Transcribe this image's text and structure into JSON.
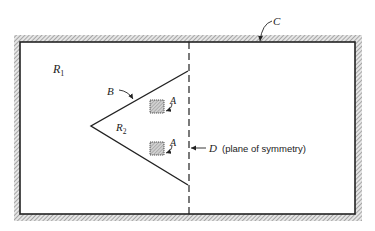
{
  "diagram": {
    "labels": {
      "R1": {
        "main": "R",
        "sub": "1"
      },
      "R2": {
        "main": "R",
        "sub": "2"
      },
      "B": "B",
      "A_top": "A",
      "A_bottom": "A",
      "C": "C",
      "D": "D",
      "D_caption": "(plane of symmetry)"
    },
    "colors": {
      "line": "#222222",
      "hatch": "#9a9a9a",
      "fill_box": "#b8b8b8",
      "background": "#ffffff"
    }
  }
}
